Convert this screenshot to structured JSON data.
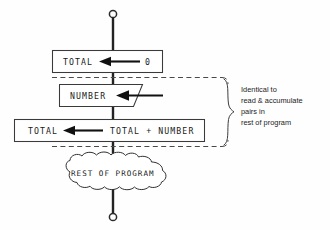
{
  "diagram": {
    "background_color": "#fefefe",
    "line_color": "#232323",
    "box_stroke_color": "#3a3a3a",
    "dashed_color": "#4a4a4a"
  },
  "terminators": {
    "top": {
      "name": "top-connector",
      "shape": "open-circle"
    },
    "bottom": {
      "name": "bottom-connector",
      "shape": "open-circle"
    }
  },
  "nodes": {
    "init_box": {
      "shape": "rectangle",
      "assign_target": "TOTAL",
      "operator": "arrow-left",
      "assign_value": "0"
    },
    "read_box": {
      "shape": "parallelogram",
      "label": "NUMBER",
      "operator": "arrow-left"
    },
    "accumulate_box": {
      "shape": "rectangle",
      "assign_target": "TOTAL",
      "operator": "arrow-left",
      "assign_value": "TOTAL + NUMBER"
    },
    "rest_cloud": {
      "shape": "cloud",
      "label": "REST OF PROGRAM"
    }
  },
  "annotation": {
    "brace": "right-curly-brace",
    "lines": [
      "Identical to",
      "read & accumulate",
      "pairs in",
      "rest of program"
    ]
  }
}
